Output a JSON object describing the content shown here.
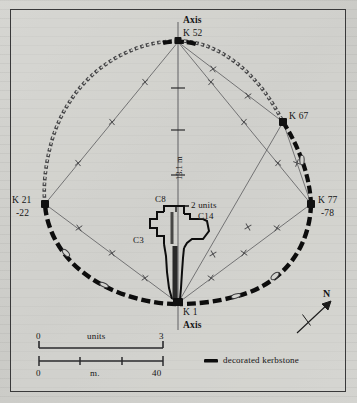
{
  "figure": {
    "type": "archaeological-site-plan"
  },
  "axis_labels": {
    "top_axis": "Axis",
    "top_stone": "K 52",
    "bottom_stone": "K 1",
    "bottom_axis": "Axis"
  },
  "kerbstones": [
    {
      "id": "k52",
      "label": "K 52",
      "sub": "",
      "position": "top"
    },
    {
      "id": "k67",
      "label": "K 67",
      "sub": "",
      "position": "upper-right"
    },
    {
      "id": "k77",
      "label": "K 77",
      "sub": "-78",
      "position": "right"
    },
    {
      "id": "k21",
      "label": "K 21",
      "sub": "-22",
      "position": "left"
    },
    {
      "id": "k1",
      "label": "K 1",
      "sub": "",
      "position": "bottom"
    }
  ],
  "chamber": {
    "labels": [
      {
        "id": "c8",
        "text": "C8"
      },
      {
        "id": "c14",
        "text": "C14"
      },
      {
        "id": "c3",
        "text": "C3"
      }
    ],
    "annotation": "2 units"
  },
  "dimension": {
    "axis_length": "13.1 m"
  },
  "scales": [
    {
      "id": "units-scale",
      "start": "0",
      "caption": "units",
      "end": "3",
      "style": "bracket"
    },
    {
      "id": "metre-scale",
      "start": "0",
      "caption": "m.",
      "end": "40",
      "style": "ticked",
      "ticks": 4
    }
  ],
  "legend": {
    "swatch": "thick-dash",
    "label": "decorated kerbstone"
  },
  "compass": {
    "label": "N",
    "bearing_description": "arrow pointing up-right"
  },
  "colors": {
    "ink": "#151515",
    "paper": "#d3d3cf",
    "survey_line": "#5a5a5c",
    "kerb_plain": "#3c3c3e",
    "kerb_decorated": "#0d0d0d"
  }
}
